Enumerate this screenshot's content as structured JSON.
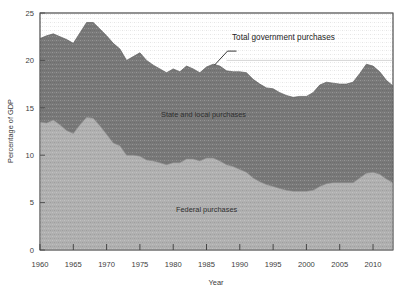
{
  "chart_data": {
    "type": "area",
    "title": "",
    "xlabel": "Year",
    "ylabel": "Percentage of GDP",
    "xlim": [
      1960,
      2013
    ],
    "ylim": [
      0,
      25
    ],
    "xticks": [
      1960,
      1965,
      1970,
      1975,
      1980,
      1985,
      1990,
      1995,
      2000,
      2005,
      2010
    ],
    "yticks": [
      0,
      5,
      10,
      15,
      20,
      25
    ],
    "grid": false,
    "stacked": true,
    "legend_position": "inline-annotations",
    "annotations": [
      {
        "text": "Total government purchases",
        "x": 1988,
        "y": 24.0
      },
      {
        "text": "State and local purchases",
        "x": 1984,
        "y": 16.2
      },
      {
        "text": "Federal purchases",
        "x": 1986,
        "y": 5.5
      }
    ],
    "reference_line": {
      "y": 20.0,
      "x_start": 1988,
      "x_end": 2013
    },
    "x": [
      1960,
      1961,
      1962,
      1963,
      1964,
      1965,
      1966,
      1967,
      1968,
      1969,
      1970,
      1971,
      1972,
      1973,
      1974,
      1975,
      1976,
      1977,
      1978,
      1979,
      1980,
      1981,
      1982,
      1983,
      1984,
      1985,
      1986,
      1987,
      1988,
      1989,
      1990,
      1991,
      1992,
      1993,
      1994,
      1995,
      1996,
      1997,
      1998,
      1999,
      2000,
      2001,
      2002,
      2003,
      2004,
      2005,
      2006,
      2007,
      2008,
      2009,
      2010,
      2011,
      2012,
      2013
    ],
    "series": [
      {
        "name": "Federal purchases",
        "color": "#b0b0b0",
        "values": [
          13.5,
          13.4,
          13.7,
          13.2,
          12.6,
          12.3,
          13.2,
          14.0,
          13.9,
          13.1,
          12.2,
          11.3,
          11.0,
          10.0,
          10.0,
          9.9,
          9.5,
          9.4,
          9.2,
          9.0,
          9.2,
          9.2,
          9.6,
          9.6,
          9.4,
          9.7,
          9.7,
          9.4,
          9.0,
          8.8,
          8.5,
          8.2,
          7.6,
          7.2,
          6.9,
          6.7,
          6.5,
          6.3,
          6.2,
          6.2,
          6.2,
          6.3,
          6.7,
          7.0,
          7.1,
          7.1,
          7.1,
          7.1,
          7.6,
          8.1,
          8.2,
          8.0,
          7.5,
          7.1
        ]
      },
      {
        "name": "State and local purchases",
        "color": "#787878",
        "values": [
          8.8,
          9.2,
          9.1,
          9.3,
          9.6,
          9.5,
          9.7,
          10.0,
          10.1,
          10.2,
          10.4,
          10.5,
          10.2,
          10.0,
          10.4,
          10.9,
          10.5,
          10.1,
          9.9,
          9.7,
          9.9,
          9.6,
          9.8,
          9.5,
          9.3,
          9.6,
          9.9,
          10.0,
          9.9,
          10.0,
          10.3,
          10.5,
          10.4,
          10.3,
          10.2,
          10.3,
          10.1,
          10.0,
          9.9,
          10.0,
          10.0,
          10.3,
          10.7,
          10.7,
          10.5,
          10.4,
          10.4,
          10.6,
          11.0,
          11.5,
          11.2,
          10.8,
          10.4,
          10.2
        ]
      }
    ],
    "total_series": {
      "name": "Total government purchases",
      "values": [
        22.3,
        22.6,
        22.8,
        22.5,
        22.2,
        21.8,
        22.9,
        24.0,
        24.0,
        23.3,
        22.6,
        21.8,
        21.2,
        20.0,
        20.4,
        20.8,
        20.0,
        19.5,
        19.1,
        18.7,
        19.1,
        18.8,
        19.4,
        19.1,
        18.7,
        19.3,
        19.6,
        19.4,
        18.9,
        18.8,
        18.8,
        18.7,
        18.0,
        17.5,
        17.1,
        17.0,
        16.6,
        16.3,
        16.1,
        16.2,
        16.2,
        16.6,
        17.4,
        17.7,
        17.6,
        17.5,
        17.5,
        17.7,
        18.6,
        19.6,
        19.4,
        18.8,
        17.9,
        17.3
      ]
    }
  },
  "axes": {
    "y_title": "Percentage of GDP",
    "x_title": "Year",
    "y_ticks": [
      "0",
      "5",
      "10",
      "15",
      "20",
      "25"
    ],
    "x_ticks": [
      "1960",
      "1965",
      "1970",
      "1975",
      "1980",
      "1985",
      "1990",
      "1995",
      "2000",
      "2005",
      "2010"
    ]
  },
  "labels": {
    "total": "Total government purchases",
    "state_local": "State and local purchases",
    "federal": "Federal purchases"
  },
  "colors": {
    "federal_fill": "#b0b0b0",
    "state_local_fill": "#787878",
    "axis": "#4a4a4a",
    "text": "#2e2e2e",
    "background": "#ffffff"
  }
}
